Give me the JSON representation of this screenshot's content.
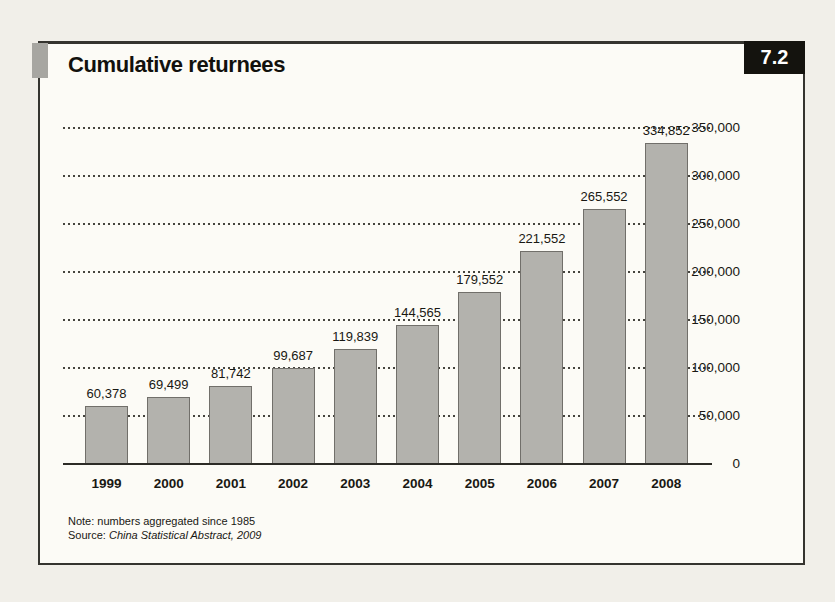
{
  "figure": {
    "number": "7.2",
    "title": "Cumulative returnees",
    "note": "Note: numbers aggregated since 1985",
    "source_label": "Source:",
    "source_title": "China Statistical Abstract, 2009"
  },
  "chart_data": {
    "type": "bar",
    "title": "Cumulative returnees",
    "categories": [
      "1999",
      "2000",
      "2001",
      "2002",
      "2003",
      "2004",
      "2005",
      "2006",
      "2007",
      "2008"
    ],
    "values": [
      60378,
      69499,
      81742,
      99687,
      119839,
      144565,
      179552,
      221552,
      265552,
      334852
    ],
    "value_labels": [
      "60,378",
      "69,499",
      "81,742",
      "99,687",
      "119,839",
      "144,565",
      "179,552",
      "221,552",
      "265,552",
      "334,852"
    ],
    "xlabel": "",
    "ylabel": "",
    "ylim": [
      0,
      350000
    ],
    "ytick_interval": 50000,
    "yticks": [
      "0",
      "50,000",
      "100,000",
      "150,000",
      "200,000",
      "250,000",
      "300,000",
      "350,000"
    ],
    "grid": "horizontal-dotted",
    "legend": "none",
    "axis_side": "right",
    "bar_color": "#b3b2ad",
    "bar_border_color": "#716f6a",
    "line_color": "#2c2b26",
    "background_color": "#fcfbf6",
    "badge_color": "#14130e",
    "tab_color": "#a7a6a1"
  }
}
